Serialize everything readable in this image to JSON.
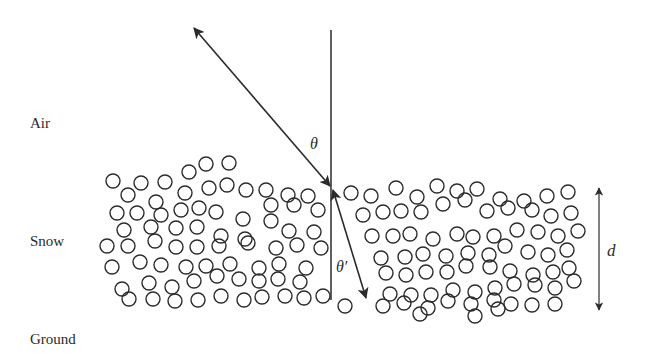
{
  "diagram": {
    "labels": {
      "air": "Air",
      "snow": "Snow",
      "ground": "Ground",
      "theta": "θ",
      "theta_prime": "θ′",
      "depth": "d"
    },
    "colors": {
      "line": "#2b2b2b",
      "background": "#ffffff"
    },
    "normal_line": {
      "x": 331,
      "y1": 30,
      "y2": 300
    },
    "incident_ray": {
      "x1": 194,
      "y1": 28,
      "x2": 330,
      "y2": 186,
      "bidirectional": true
    },
    "refracted_ray": {
      "x1": 333,
      "y1": 190,
      "x2": 366,
      "y2": 298,
      "bidirectional": true
    },
    "depth_arrow": {
      "x": 599,
      "y1": 188,
      "y2": 310
    },
    "grain_radius": 7,
    "grains": [
      [
        113,
        181
      ],
      [
        141,
        183
      ],
      [
        165,
        182
      ],
      [
        189,
        172
      ],
      [
        206,
        164
      ],
      [
        229,
        163
      ],
      [
        128,
        195
      ],
      [
        156,
        202
      ],
      [
        185,
        193
      ],
      [
        209,
        188
      ],
      [
        227,
        185
      ],
      [
        246,
        190
      ],
      [
        266,
        190
      ],
      [
        288,
        195
      ],
      [
        308,
        196
      ],
      [
        117,
        213
      ],
      [
        137,
        213
      ],
      [
        161,
        215
      ],
      [
        181,
        210
      ],
      [
        199,
        208
      ],
      [
        216,
        212
      ],
      [
        243,
        219
      ],
      [
        271,
        205
      ],
      [
        294,
        205
      ],
      [
        318,
        210
      ],
      [
        124,
        230
      ],
      [
        151,
        227
      ],
      [
        176,
        228
      ],
      [
        197,
        227
      ],
      [
        221,
        236
      ],
      [
        245,
        239
      ],
      [
        271,
        221
      ],
      [
        289,
        231
      ],
      [
        314,
        232
      ],
      [
        107,
        246
      ],
      [
        128,
        246
      ],
      [
        155,
        241
      ],
      [
        176,
        247
      ],
      [
        197,
        247
      ],
      [
        219,
        246
      ],
      [
        248,
        243
      ],
      [
        276,
        248
      ],
      [
        297,
        245
      ],
      [
        321,
        248
      ],
      [
        112,
        267
      ],
      [
        140,
        262
      ],
      [
        161,
        265
      ],
      [
        186,
        267
      ],
      [
        206,
        266
      ],
      [
        230,
        264
      ],
      [
        259,
        268
      ],
      [
        279,
        264
      ],
      [
        306,
        268
      ],
      [
        122,
        289
      ],
      [
        149,
        283
      ],
      [
        172,
        287
      ],
      [
        194,
        281
      ],
      [
        217,
        276
      ],
      [
        239,
        279
      ],
      [
        259,
        281
      ],
      [
        278,
        279
      ],
      [
        300,
        282
      ],
      [
        129,
        299
      ],
      [
        153,
        299
      ],
      [
        175,
        301
      ],
      [
        198,
        300
      ],
      [
        221,
        296
      ],
      [
        244,
        300
      ],
      [
        262,
        297
      ],
      [
        285,
        296
      ],
      [
        304,
        298
      ],
      [
        323,
        296
      ],
      [
        345,
        306
      ],
      [
        351,
        193
      ],
      [
        371,
        196
      ],
      [
        396,
        188
      ],
      [
        417,
        197
      ],
      [
        437,
        186
      ],
      [
        457,
        191
      ],
      [
        477,
        189
      ],
      [
        500,
        199
      ],
      [
        524,
        201
      ],
      [
        547,
        196
      ],
      [
        568,
        192
      ],
      [
        363,
        215
      ],
      [
        383,
        212
      ],
      [
        401,
        211
      ],
      [
        421,
        212
      ],
      [
        443,
        204
      ],
      [
        465,
        200
      ],
      [
        487,
        211
      ],
      [
        508,
        208
      ],
      [
        532,
        210
      ],
      [
        551,
        216
      ],
      [
        571,
        213
      ],
      [
        372,
        236
      ],
      [
        393,
        236
      ],
      [
        410,
        234
      ],
      [
        433,
        239
      ],
      [
        457,
        234
      ],
      [
        473,
        237
      ],
      [
        494,
        236
      ],
      [
        517,
        230
      ],
      [
        538,
        232
      ],
      [
        558,
        236
      ],
      [
        578,
        231
      ],
      [
        381,
        258
      ],
      [
        405,
        257
      ],
      [
        423,
        254
      ],
      [
        446,
        256
      ],
      [
        468,
        253
      ],
      [
        489,
        255
      ],
      [
        505,
        246
      ],
      [
        528,
        252
      ],
      [
        548,
        255
      ],
      [
        567,
        250
      ],
      [
        386,
        273
      ],
      [
        406,
        275
      ],
      [
        426,
        272
      ],
      [
        447,
        272
      ],
      [
        466,
        266
      ],
      [
        490,
        267
      ],
      [
        510,
        271
      ],
      [
        533,
        275
      ],
      [
        553,
        272
      ],
      [
        569,
        268
      ],
      [
        390,
        294
      ],
      [
        411,
        295
      ],
      [
        431,
        295
      ],
      [
        453,
        290
      ],
      [
        475,
        292
      ],
      [
        495,
        288
      ],
      [
        514,
        284
      ],
      [
        535,
        285
      ],
      [
        555,
        288
      ],
      [
        574,
        281
      ],
      [
        383,
        306
      ],
      [
        404,
        303
      ],
      [
        428,
        308
      ],
      [
        448,
        301
      ],
      [
        471,
        304
      ],
      [
        494,
        300
      ],
      [
        511,
        304
      ],
      [
        532,
        305
      ],
      [
        555,
        304
      ],
      [
        420,
        314
      ],
      [
        475,
        316
      ],
      [
        498,
        309
      ]
    ]
  }
}
